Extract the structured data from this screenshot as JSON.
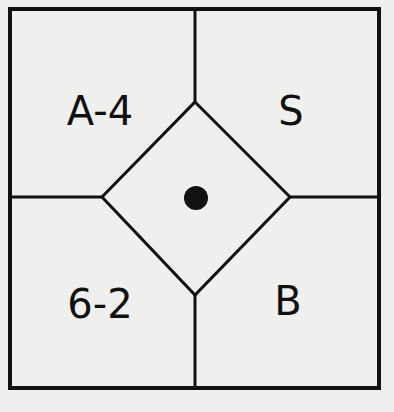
{
  "diagram": {
    "regions": [
      {
        "id": "top-left",
        "label": "A-4"
      },
      {
        "id": "top-right",
        "label": "S"
      },
      {
        "id": "bottom-left",
        "label": "6-2"
      },
      {
        "id": "bottom-right",
        "label": "B"
      },
      {
        "id": "center-diamond",
        "label": ""
      }
    ],
    "colors": {
      "background": "#efefed",
      "line": "#111111"
    }
  }
}
